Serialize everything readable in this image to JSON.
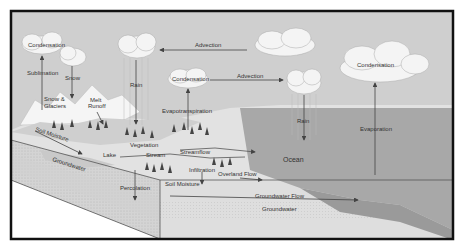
{
  "colors": {
    "frame": "#111111",
    "sky": "#cfcfcf",
    "ocean": "#a8a8a8",
    "land_top": "#dcdcdc",
    "soil": "#c8c8c8",
    "groundwater": "#d6d6d6",
    "cloud": "#f4f4f4",
    "arrow": "#444444"
  },
  "labels": {
    "condensation_1": "Condensation",
    "sublimation": "Sublimation",
    "snow": "Snow",
    "snow_glaciers_1": "Snow &",
    "snow_glaciers_2": "Glaciers",
    "melt_runoff_1": "Melt",
    "melt_runoff_2": "Runoff",
    "rain_1": "Rain",
    "advection_1": "Advection",
    "condensation_2": "Condensation",
    "advection_2": "Advection",
    "evapotranspiration": "Evapotranspiration",
    "rain_2": "Rain",
    "condensation_3": "Condensation",
    "evaporation": "Evaporation",
    "ocean": "Ocean",
    "soil_moisture_1": "Soil Moisture",
    "groundwater_1": "Groundwater",
    "lake": "Lake",
    "vegetation": "Vegetation",
    "stream": "Stream",
    "streamflow": "Streamflow",
    "infiltration": "Infiltration",
    "overland_flow": "Overland Flow",
    "soil_moisture_2": "Soil Moisture",
    "percolation": "Percolation",
    "groundwater_flow": "Groundwater Flow",
    "groundwater_2": "Groundwater"
  }
}
